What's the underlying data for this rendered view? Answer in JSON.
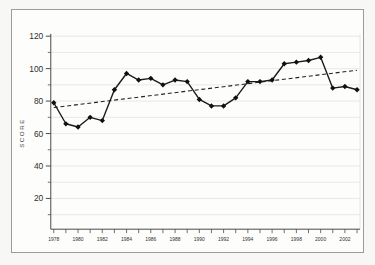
{
  "window": {
    "outer_background": "#f7f7f5",
    "frame_border_color": "#9b9b9b",
    "chart_background": "#fdfdfc"
  },
  "chart_data": {
    "type": "line",
    "title": "",
    "xlabel": "",
    "ylabel": "SCORE",
    "x": [
      1978,
      1979,
      1980,
      1981,
      1982,
      1983,
      1984,
      1985,
      1986,
      1987,
      1988,
      1989,
      1990,
      1991,
      1992,
      1993,
      1994,
      1995,
      1996,
      1997,
      1998,
      1999,
      2000,
      2001,
      2002,
      2003
    ],
    "series": [
      {
        "name": "score",
        "marker": "diamond",
        "values": [
          79,
          66,
          64,
          70,
          68,
          87,
          97,
          93,
          94,
          90,
          93,
          92,
          81,
          77,
          77,
          82,
          92,
          92,
          93,
          103,
          104,
          105,
          107,
          88,
          89,
          87
        ]
      }
    ],
    "trend_line": {
      "style": "dashed",
      "x_start": 1978,
      "value_start": 76,
      "x_end": 2003,
      "value_end": 99
    },
    "ylim": [
      0,
      120
    ],
    "yticks": [
      "20",
      "40",
      "60",
      "80",
      "100",
      "120"
    ],
    "ytick_values": [
      20,
      40,
      60,
      80,
      100,
      120
    ],
    "y_minor_tick_step": 10,
    "xtick_labels": [
      "1978",
      "1980",
      "1982",
      "1984",
      "1986",
      "1988",
      "1990",
      "1992",
      "1994",
      "1996",
      "1998",
      "2000",
      "2002"
    ],
    "xtick_minor_every_year": true,
    "grid": "horizontal lines every 10 units",
    "legend": "none",
    "colors": {
      "line": "#1b1b1b",
      "marker": "#101010",
      "trend": "#222222",
      "grid": "#e3e3e0",
      "axis": "#4a4a4a",
      "tick_label": "#2e2e2e",
      "axis_title": "#3d3d3d"
    }
  }
}
